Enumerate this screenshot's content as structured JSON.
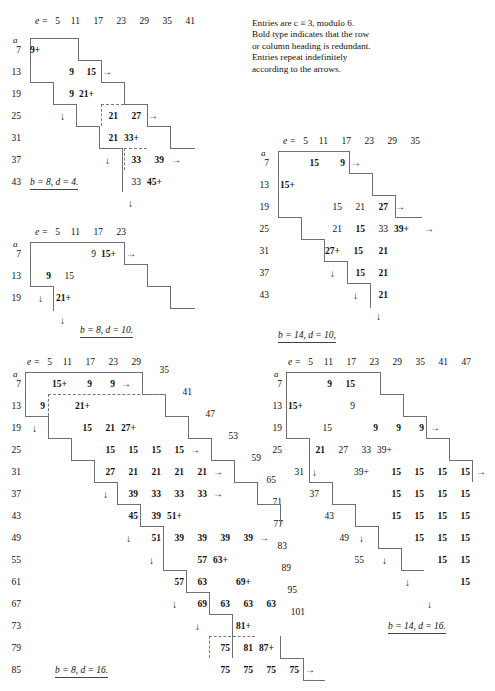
{
  "note": {
    "lines": [
      "Entries are c ≡ 3, modulo 6.",
      "Bold type indicates that the row",
      "or column heading is redundant.",
      "Entries repeat indefinitely",
      "according to the arrows."
    ]
  },
  "symbols": {
    "e_label": "e =",
    "a_label": "a",
    "right_arrow": "→",
    "down_arrow": "↓",
    "plus": "+"
  },
  "tables": [
    {
      "id": "table-b8-d4",
      "caption": "b = 8, d = 4.",
      "col_headers": [
        "5",
        "11",
        "17",
        "23",
        "29",
        "35",
        "41"
      ],
      "row_headers": [
        "7",
        "13",
        "19",
        "25",
        "31",
        "37",
        "43"
      ],
      "entries": [
        {
          "row": "7",
          "col": "5",
          "value": "9",
          "plus": true,
          "bold": false
        },
        {
          "row": "13",
          "col": "11",
          "value": "9",
          "plus": false,
          "bold": true
        },
        {
          "row": "13",
          "col": "17",
          "value": "15",
          "plus": false,
          "bold": true
        },
        {
          "row": "19",
          "col": "11",
          "value": "9",
          "plus": false,
          "bold": true
        },
        {
          "row": "19",
          "col": "17",
          "value": "21",
          "plus": true,
          "bold": true
        },
        {
          "row": "25",
          "col": "23",
          "value": "21",
          "plus": false,
          "bold": true
        },
        {
          "row": "25",
          "col": "29",
          "value": "27",
          "plus": false,
          "bold": true
        },
        {
          "row": "31",
          "col": "23",
          "value": "21",
          "plus": false,
          "bold": true
        },
        {
          "row": "31",
          "col": "29",
          "value": "33",
          "plus": true,
          "bold": true
        },
        {
          "row": "37",
          "col": "35",
          "value": "33",
          "plus": false,
          "bold": true
        },
        {
          "row": "37",
          "col": "41",
          "value": "39",
          "plus": false,
          "bold": true
        },
        {
          "row": "43",
          "col": "35",
          "value": "33",
          "plus": false,
          "bold": false
        },
        {
          "row": "43",
          "col": "41",
          "value": "45",
          "plus": true,
          "bold": true
        }
      ]
    },
    {
      "id": "table-b14-d10",
      "caption": "b = 14, d = 10,",
      "col_headers": [
        "5",
        "11",
        "17",
        "23",
        "29",
        "35"
      ],
      "row_headers": [
        "7",
        "13",
        "19",
        "25",
        "31",
        "37",
        "43"
      ],
      "entries": [
        {
          "row": "7",
          "col": "11",
          "value": "15",
          "plus": false,
          "bold": true
        },
        {
          "row": "7",
          "col": "17",
          "value": "9",
          "plus": false,
          "bold": true
        },
        {
          "row": "13",
          "col": "5",
          "value": "15",
          "plus": true,
          "bold": true
        },
        {
          "row": "19",
          "col": "17",
          "value": "15",
          "plus": false,
          "bold": false
        },
        {
          "row": "19",
          "col": "23",
          "value": "21",
          "plus": false,
          "bold": false
        },
        {
          "row": "19",
          "col": "29",
          "value": "27",
          "plus": false,
          "bold": true
        },
        {
          "row": "25",
          "col": "17",
          "value": "21",
          "plus": false,
          "bold": false
        },
        {
          "row": "25",
          "col": "23",
          "value": "15",
          "plus": false,
          "bold": true
        },
        {
          "row": "25",
          "col": "29",
          "value": "33",
          "plus": false,
          "bold": false
        },
        {
          "row": "25",
          "col": "35",
          "value": "39",
          "plus": true,
          "bold": true
        },
        {
          "row": "31",
          "col": "17",
          "value": "27",
          "plus": true,
          "bold": true
        },
        {
          "row": "31",
          "col": "23",
          "value": "15",
          "plus": false,
          "bold": true
        },
        {
          "row": "31",
          "col": "29",
          "value": "21",
          "plus": false,
          "bold": true
        },
        {
          "row": "37",
          "col": "23",
          "value": "15",
          "plus": false,
          "bold": true
        },
        {
          "row": "37",
          "col": "29",
          "value": "21",
          "plus": false,
          "bold": true
        },
        {
          "row": "43",
          "col": "29",
          "value": "21",
          "plus": false,
          "bold": true
        }
      ]
    },
    {
      "id": "table-b8-d10",
      "caption": "b = 8, d = 10.",
      "col_headers": [
        "5",
        "11",
        "17",
        "23"
      ],
      "row_headers": [
        "7",
        "13",
        "19"
      ],
      "entries": [
        {
          "row": "7",
          "col": "17",
          "value": "9",
          "plus": false,
          "bold": false
        },
        {
          "row": "7",
          "col": "23",
          "value": "15",
          "plus": true,
          "bold": true
        },
        {
          "row": "13",
          "col": "11",
          "value": "9",
          "plus": false,
          "bold": true
        },
        {
          "row": "13",
          "col": "17",
          "value": "15",
          "plus": false,
          "bold": false
        },
        {
          "row": "19",
          "col": "17",
          "value": "21",
          "plus": true,
          "bold": true
        }
      ]
    },
    {
      "id": "table-b8-d16",
      "caption": "b = 8, d = 16.",
      "col_headers": [
        "5",
        "11",
        "17",
        "23",
        "29",
        "35",
        "41",
        "47",
        "53",
        "59",
        "65",
        "71",
        "77",
        "83",
        "89",
        "95",
        "101"
      ],
      "row_headers": [
        "7",
        "13",
        "19",
        "25",
        "31",
        "37",
        "43",
        "49",
        "55",
        "61",
        "67",
        "73",
        "79",
        "85"
      ],
      "entries": [
        {
          "row": "7",
          "col": "11",
          "value": "15",
          "plus": true,
          "bold": true
        },
        {
          "row": "7",
          "col": "17",
          "value": "9",
          "plus": false,
          "bold": true
        },
        {
          "row": "7",
          "col": "23",
          "value": "9",
          "plus": false,
          "bold": true
        },
        {
          "row": "13",
          "col": "5",
          "value": "9",
          "plus": false,
          "bold": true
        },
        {
          "row": "13",
          "col": "17",
          "value": "21",
          "plus": true,
          "bold": true
        },
        {
          "row": "19",
          "col": "17",
          "value": "15",
          "plus": false,
          "bold": true
        },
        {
          "row": "19",
          "col": "23",
          "value": "21",
          "plus": false,
          "bold": true
        },
        {
          "row": "19",
          "col": "29",
          "value": "27",
          "plus": true,
          "bold": true
        },
        {
          "row": "25",
          "col": "23",
          "value": "15",
          "plus": false,
          "bold": true
        },
        {
          "row": "25",
          "col": "29",
          "value": "15",
          "plus": false,
          "bold": true
        },
        {
          "row": "25",
          "col": "35",
          "value": "15",
          "plus": false,
          "bold": true
        },
        {
          "row": "25",
          "col": "41",
          "value": "15",
          "plus": false,
          "bold": true
        },
        {
          "row": "31",
          "col": "23",
          "value": "27",
          "plus": false,
          "bold": true
        },
        {
          "row": "31",
          "col": "29",
          "value": "21",
          "plus": false,
          "bold": true
        },
        {
          "row": "31",
          "col": "35",
          "value": "21",
          "plus": false,
          "bold": true
        },
        {
          "row": "31",
          "col": "41",
          "value": "21",
          "plus": false,
          "bold": true
        },
        {
          "row": "31",
          "col": "47",
          "value": "21",
          "plus": false,
          "bold": true
        },
        {
          "row": "37",
          "col": "29",
          "value": "39",
          "plus": false,
          "bold": true
        },
        {
          "row": "37",
          "col": "35",
          "value": "33",
          "plus": false,
          "bold": true
        },
        {
          "row": "37",
          "col": "41",
          "value": "33",
          "plus": false,
          "bold": true
        },
        {
          "row": "37",
          "col": "47",
          "value": "33",
          "plus": false,
          "bold": true
        },
        {
          "row": "43",
          "col": "29",
          "value": "45",
          "plus": false,
          "bold": true
        },
        {
          "row": "43",
          "col": "35",
          "value": "39",
          "plus": false,
          "bold": true
        },
        {
          "row": "43",
          "col": "41",
          "value": "51",
          "plus": true,
          "bold": true
        },
        {
          "row": "49",
          "col": "35",
          "value": "51",
          "plus": false,
          "bold": true
        },
        {
          "row": "49",
          "col": "41",
          "value": "39",
          "plus": false,
          "bold": true
        },
        {
          "row": "49",
          "col": "47",
          "value": "39",
          "plus": false,
          "bold": true
        },
        {
          "row": "49",
          "col": "53",
          "value": "39",
          "plus": false,
          "bold": true
        },
        {
          "row": "49",
          "col": "59",
          "value": "39",
          "plus": false,
          "bold": true
        },
        {
          "row": "55",
          "col": "53",
          "value": "57",
          "plus": false,
          "bold": true
        },
        {
          "row": "55",
          "col": "59",
          "value": "63",
          "plus": true,
          "bold": true
        },
        {
          "row": "61",
          "col": "47",
          "value": "57",
          "plus": false,
          "bold": true
        },
        {
          "row": "61",
          "col": "53",
          "value": "63",
          "plus": false,
          "bold": true
        },
        {
          "row": "61",
          "col": "65",
          "value": "69",
          "plus": true,
          "bold": true
        },
        {
          "row": "67",
          "col": "53",
          "value": "69",
          "plus": false,
          "bold": true
        },
        {
          "row": "67",
          "col": "65",
          "value": "63",
          "plus": false,
          "bold": true
        },
        {
          "row": "67",
          "col": "71",
          "value": "63",
          "plus": false,
          "bold": true
        },
        {
          "row": "67",
          "col": "77",
          "value": "63",
          "plus": false,
          "bold": true
        },
        {
          "row": "73",
          "col": "71",
          "value": "81",
          "plus": true,
          "bold": true
        },
        {
          "row": "79",
          "col": "65",
          "value": "75",
          "plus": false,
          "bold": true
        },
        {
          "row": "79",
          "col": "71",
          "value": "81",
          "plus": false,
          "bold": true
        },
        {
          "row": "79",
          "col": "77",
          "value": "87",
          "plus": true,
          "bold": true
        },
        {
          "row": "85",
          "col": "65",
          "value": "75",
          "plus": false,
          "bold": true
        },
        {
          "row": "85",
          "col": "71",
          "value": "75",
          "plus": false,
          "bold": true
        },
        {
          "row": "85",
          "col": "77",
          "value": "75",
          "plus": false,
          "bold": true
        },
        {
          "row": "85",
          "col": "83",
          "value": "75",
          "plus": false,
          "bold": true
        }
      ]
    },
    {
      "id": "table-b14-d16",
      "caption": "b = 14, d = 16.",
      "col_headers": [
        "5",
        "11",
        "17",
        "23",
        "29",
        "35",
        "41",
        "47"
      ],
      "row_headers": [
        "7",
        "13",
        "19",
        "25",
        "31",
        "37",
        "43",
        "49",
        "55"
      ],
      "entries": [
        {
          "row": "7",
          "col": "11",
          "value": "9",
          "plus": false,
          "bold": true
        },
        {
          "row": "7",
          "col": "17",
          "value": "15",
          "plus": false,
          "bold": true
        },
        {
          "row": "13",
          "col": "5",
          "value": "15",
          "plus": true,
          "bold": true
        },
        {
          "row": "13",
          "col": "17",
          "value": "9",
          "plus": false,
          "bold": false
        },
        {
          "row": "19",
          "col": "11",
          "value": "15",
          "plus": false,
          "bold": false
        },
        {
          "row": "19",
          "col": "23",
          "value": "9",
          "plus": false,
          "bold": true
        },
        {
          "row": "19",
          "col": "29",
          "value": "9",
          "plus": false,
          "bold": true
        },
        {
          "row": "19",
          "col": "35",
          "value": "9",
          "plus": false,
          "bold": true
        },
        {
          "row": "25",
          "col": "11",
          "value": "21",
          "plus": false,
          "bold": true
        },
        {
          "row": "25",
          "col": "17",
          "value": "27",
          "plus": false,
          "bold": false
        },
        {
          "row": "25",
          "col": "23",
          "value": "33",
          "plus": false,
          "bold": false
        },
        {
          "row": "25",
          "col": "29",
          "value": "39",
          "plus": true,
          "bold": false
        },
        {
          "row": "31",
          "col": "23",
          "value": "39",
          "plus": true,
          "bold": false
        },
        {
          "row": "31",
          "col": "29",
          "value": "15",
          "plus": false,
          "bold": true
        },
        {
          "row": "31",
          "col": "35",
          "value": "15",
          "plus": false,
          "bold": true
        },
        {
          "row": "31",
          "col": "41",
          "value": "15",
          "plus": false,
          "bold": true
        },
        {
          "row": "31",
          "col": "47",
          "value": "15",
          "plus": false,
          "bold": true
        },
        {
          "row": "37",
          "col": "29",
          "value": "15",
          "plus": false,
          "bold": true
        },
        {
          "row": "37",
          "col": "35",
          "value": "15",
          "plus": false,
          "bold": true
        },
        {
          "row": "37",
          "col": "41",
          "value": "15",
          "plus": false,
          "bold": true
        },
        {
          "row": "37",
          "col": "47",
          "value": "15",
          "plus": false,
          "bold": true
        },
        {
          "row": "43",
          "col": "29",
          "value": "15",
          "plus": false,
          "bold": true
        },
        {
          "row": "43",
          "col": "35",
          "value": "15",
          "plus": false,
          "bold": true
        },
        {
          "row": "43",
          "col": "41",
          "value": "15",
          "plus": false,
          "bold": true
        },
        {
          "row": "43",
          "col": "47",
          "value": "15",
          "plus": false,
          "bold": true
        },
        {
          "row": "49",
          "col": "35",
          "value": "15",
          "plus": false,
          "bold": true
        },
        {
          "row": "49",
          "col": "41",
          "value": "15",
          "plus": false,
          "bold": true
        },
        {
          "row": "49",
          "col": "47",
          "value": "15",
          "plus": false,
          "bold": true
        },
        {
          "row": "55",
          "col": "41",
          "value": "15",
          "plus": false,
          "bold": true
        },
        {
          "row": "55",
          "col": "47",
          "value": "15",
          "plus": false,
          "bold": true
        },
        {
          "row": "61",
          "col": "47",
          "value": "15",
          "plus": false,
          "bold": true
        }
      ]
    }
  ]
}
